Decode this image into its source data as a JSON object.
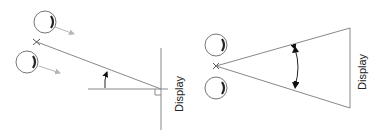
{
  "diagram": {
    "colors": {
      "line": "#888888",
      "dark": "#222222",
      "arrow_gray": "#b5b5b5"
    },
    "left_panel": {
      "display_label": "Display",
      "description": "Viewing angle measured from the display normal; observer eyes off-axis"
    },
    "right_panel": {
      "display_label": "Display",
      "description": "Angle subtended by the display at the observer position"
    }
  }
}
